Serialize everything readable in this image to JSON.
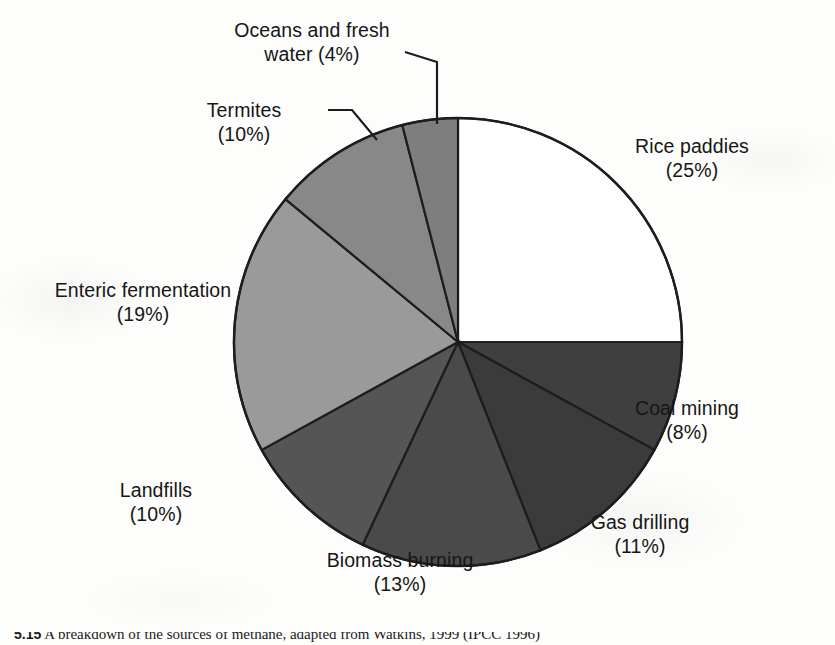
{
  "chart_data": {
    "type": "pie",
    "title": "",
    "subtitle": "",
    "xlabel": "",
    "ylabel": "",
    "legend_position": "callout-labels",
    "grid": false,
    "start_angle_deg": 0,
    "direction": "clockwise",
    "unit": "%",
    "categories": [
      "Rice paddies",
      "Coal mining",
      "Gas drilling",
      "Biomass burning",
      "Landfills",
      "Enteric fermentation",
      "Termites",
      "Oceans and fresh water"
    ],
    "values": [
      25,
      8,
      11,
      13,
      10,
      19,
      10,
      4
    ],
    "total": 100,
    "slices": [
      {
        "label": "Rice paddies",
        "value": 25,
        "percent_text": "(25%)",
        "color": "#ffffff",
        "label_text": "Rice paddies\n(25%)",
        "has_leader": false
      },
      {
        "label": "Coal mining",
        "value": 8,
        "percent_text": "(8%)",
        "color": "#3f3f3f",
        "label_text": "Coal mining\n(8%)",
        "has_leader": false
      },
      {
        "label": "Gas drilling",
        "value": 11,
        "percent_text": "(11%)",
        "color": "#3b3b3b",
        "label_text": "Gas drilling\n(11%)",
        "has_leader": false
      },
      {
        "label": "Biomass burning",
        "value": 13,
        "percent_text": "(13%)",
        "color": "#4a4a4a",
        "label_text": "Biomass burning\n(13%)",
        "has_leader": false
      },
      {
        "label": "Landfills",
        "value": 10,
        "percent_text": "(10%)",
        "color": "#555555",
        "label_text": "Landfills\n(10%)",
        "has_leader": false
      },
      {
        "label": "Enteric fermentation",
        "value": 19,
        "percent_text": "(19%)",
        "color": "#9a9a9a",
        "label_text": "Enteric fermentation\n(19%)",
        "has_leader": false
      },
      {
        "label": "Termites",
        "value": 10,
        "percent_text": "(10%)",
        "color": "#888888",
        "label_text": "Termites\n(10%)",
        "has_leader": true
      },
      {
        "label": "Oceans and fresh water",
        "value": 4,
        "percent_text": "(4%)",
        "color": "#7e7e7e",
        "label_text": "Oceans and fresh\nwater (4%)",
        "has_leader": true
      }
    ]
  },
  "caption": {
    "number": "5.15",
    "text": "A breakdown of the sources of methane, adapted from Watkins, 1999 (IPCC 1996)"
  },
  "colors": {
    "outline": "#1d1d1d",
    "background": "#fdfdfb",
    "text": "#161616"
  }
}
